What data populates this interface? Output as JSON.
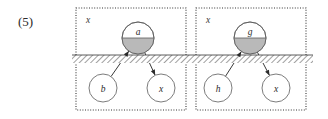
{
  "figure": {
    "equation_label": "(5)",
    "ground": {
      "x_start": 72,
      "x_end": 313,
      "y_top": 55,
      "y_bottom": 63,
      "hatch_color": "#777777",
      "line_color": "#4a4a4a"
    },
    "colors": {
      "box_stroke": "#333333",
      "node_stroke": "#5a5a5a",
      "node_fill": "#ffffff",
      "node_shaded_fill": "#b9b9b9",
      "edge_stroke": "#3a3a3a",
      "text": "#2b2b2b",
      "background": "#ffffff"
    },
    "groups": [
      {
        "name": "group-left",
        "corner_label": "x",
        "box": {
          "x": 76,
          "y": 8,
          "width": 110,
          "height": 102
        },
        "nodes": [
          {
            "id": "top",
            "label": "a",
            "cx": 138,
            "cy": 38,
            "r": 16,
            "style": "half-shaded"
          },
          {
            "id": "bottom-left",
            "label": "b",
            "cx": 103,
            "cy": 88,
            "r": 14,
            "style": "plain"
          },
          {
            "id": "bottom-right",
            "label": "x",
            "cx": 161,
            "cy": 88,
            "r": 14,
            "style": "plain"
          }
        ],
        "edges": [
          {
            "from": "bottom-left",
            "to": "top",
            "arrow_at": "to"
          },
          {
            "from": "top",
            "to": "bottom-right",
            "arrow_at": "to"
          }
        ]
      },
      {
        "name": "group-right",
        "corner_label": "x",
        "box": {
          "x": 196,
          "y": 8,
          "width": 110,
          "height": 102
        },
        "nodes": [
          {
            "id": "top",
            "label": "g",
            "cx": 250,
            "cy": 38,
            "r": 16,
            "style": "half-shaded"
          },
          {
            "id": "bottom-left",
            "label": "h",
            "cx": 218,
            "cy": 88,
            "r": 14,
            "style": "plain"
          },
          {
            "id": "bottom-right",
            "label": "x",
            "cx": 276,
            "cy": 88,
            "r": 14,
            "style": "plain"
          }
        ],
        "edges": [
          {
            "from": "bottom-left",
            "to": "top",
            "arrow_at": "to"
          },
          {
            "from": "top",
            "to": "bottom-right",
            "arrow_at": "to"
          }
        ]
      }
    ]
  }
}
